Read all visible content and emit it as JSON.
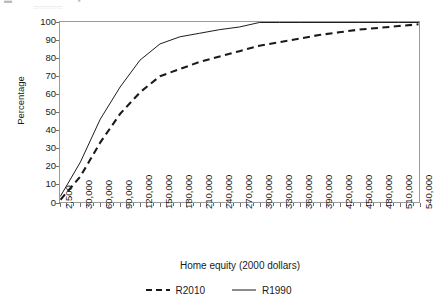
{
  "figure": {
    "top_fragment_left": "▬",
    "top_fragment_mid": "▪",
    "top_fragment_faint": "▭▭▭▭▭"
  },
  "axes": {
    "y_title": "Percentage",
    "x_title": "Home equity (2000 dollars)",
    "y_ticks": [
      "0",
      "10",
      "20",
      "30",
      "40",
      "50",
      "60",
      "70",
      "80",
      "90",
      "100"
    ],
    "x_ticks": [
      "2,500",
      "30,000",
      "60,000",
      "90,000",
      "120,000",
      "150,000",
      "180,000",
      "210,000",
      "240,000",
      "270,000",
      "300,000",
      "330,000",
      "360,000",
      "390,000",
      "420,000",
      "450,000",
      "480,000",
      "510,000",
      "540,000"
    ]
  },
  "legend": {
    "items": [
      {
        "label": "R2010",
        "style": "dashed",
        "color": "#1a1a1a"
      },
      {
        "label": "R1990",
        "style": "solid",
        "color": "#1a1a1a"
      }
    ]
  },
  "colors": {
    "line": "#1a1a1a",
    "axis": "#9a9a9a",
    "tick": "#6e6e6e",
    "plot_background": "#ffffff"
  },
  "chart_data": {
    "type": "line",
    "title": "",
    "subtitle": "",
    "xlabel": "Home equity (2000 dollars)",
    "ylabel": "Percentage",
    "xlim": [
      2500,
      540000
    ],
    "ylim": [
      0,
      100
    ],
    "grid": false,
    "legend_position": "bottom",
    "x": [
      2500,
      30000,
      60000,
      90000,
      120000,
      150000,
      180000,
      210000,
      240000,
      270000,
      300000,
      330000,
      360000,
      390000,
      420000,
      450000,
      480000,
      510000,
      540000
    ],
    "series": [
      {
        "name": "R1990",
        "style": "solid",
        "values": [
          3,
          22,
          46,
          64,
          79,
          88,
          92,
          94,
          96,
          97.5,
          100,
          100,
          100,
          100,
          100,
          100,
          100,
          100,
          100
        ]
      },
      {
        "name": "R2010",
        "style": "dashed",
        "values": [
          1,
          14,
          33,
          49,
          61,
          70,
          74,
          78,
          81,
          84,
          87,
          89,
          91,
          93,
          94.5,
          96,
          97,
          98,
          99
        ]
      }
    ]
  }
}
